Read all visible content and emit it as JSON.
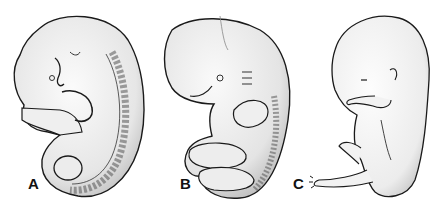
{
  "figure": {
    "panels": [
      {
        "id": "A",
        "label": "A"
      },
      {
        "id": "B",
        "label": "B"
      },
      {
        "id": "C",
        "label": "C"
      }
    ],
    "colors": {
      "background": "#ffffff",
      "ink": "#1a1a1a",
      "shade": "#d8d8d8"
    }
  }
}
